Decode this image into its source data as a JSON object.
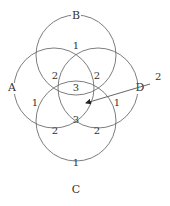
{
  "diagram": {
    "type": "four-set overlapping circles",
    "colors": {
      "stroke": "#6e6e6e",
      "text": "#333333",
      "background": "#ffffff"
    },
    "circles": [
      {
        "label": "B",
        "cx": 76,
        "cy": 55,
        "r": 40,
        "label_pos": [
          76,
          19
        ]
      },
      {
        "label": "A",
        "cx": 54,
        "cy": 88,
        "r": 40,
        "label_pos": [
          12,
          91
        ]
      },
      {
        "label": "D",
        "cx": 98,
        "cy": 88,
        "r": 40,
        "label_pos": [
          140,
          91
        ]
      },
      {
        "label": "C",
        "cx": 76,
        "cy": 121,
        "r": 40,
        "label_pos": [
          76,
          193
        ]
      }
    ],
    "regions": [
      {
        "value": "1",
        "pos": [
          76,
          49
        ]
      },
      {
        "value": "2",
        "pos": [
          55,
          79
        ]
      },
      {
        "value": "2",
        "pos": [
          97,
          79
        ]
      },
      {
        "value": "3",
        "pos": [
          76,
          91
        ]
      },
      {
        "value": "1",
        "pos": [
          35,
          106
        ]
      },
      {
        "value": "1",
        "pos": [
          117,
          106
        ]
      },
      {
        "value": "3",
        "pos": [
          76,
          123
        ]
      },
      {
        "value": "2",
        "pos": [
          55,
          134
        ]
      },
      {
        "value": "2",
        "pos": [
          97,
          134
        ]
      },
      {
        "value": "1",
        "pos": [
          76,
          166
        ]
      }
    ],
    "callout": {
      "value": "2",
      "label_pos": [
        155,
        84
      ],
      "arrow_from": [
        150,
        84
      ],
      "arrow_to": [
        86,
        103
      ]
    }
  }
}
